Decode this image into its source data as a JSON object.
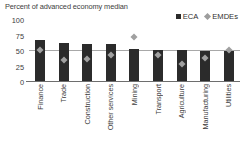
{
  "chart_data": {
    "type": "bar",
    "title": "Percent of advanced economy median",
    "xlabel": "",
    "ylabel": "",
    "ylim": [
      0,
      100
    ],
    "yticks": [
      0,
      25,
      50,
      75,
      100
    ],
    "grid": false,
    "legend_position": "top-right",
    "categories": [
      "Finance",
      "Trade",
      "Construction",
      "Other services",
      "Mining",
      "Transport",
      "Agriculture",
      "Manufacturing",
      "Utilities"
    ],
    "series": [
      {
        "name": "ECA",
        "type": "bar",
        "color": "#2b2b2b",
        "values": [
          68,
          63,
          62,
          61,
          53,
          52,
          51,
          50,
          50
        ]
      },
      {
        "name": "EMDEs",
        "type": "marker",
        "marker": "diamond",
        "color": "#a0a0a0",
        "values": [
          51,
          36,
          37,
          43,
          72,
          43,
          28,
          38,
          51
        ]
      }
    ],
    "reference_line": {
      "name": "advanced-economy-median-reference",
      "value": 50,
      "color": "#a8a8a8"
    }
  },
  "legend": {
    "items": [
      {
        "label": "ECA",
        "icon": "square-marker",
        "color": "#2b2b2b"
      },
      {
        "label": "EMDEs",
        "icon": "diamond-marker",
        "color": "#9d9d9d"
      }
    ]
  }
}
